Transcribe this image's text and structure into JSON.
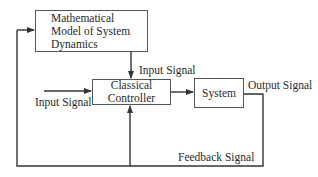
{
  "diagram": {
    "blocks": {
      "model": {
        "lines": [
          "Mathematical",
          "Model of System",
          "Dynamics"
        ]
      },
      "controller": {
        "lines": [
          "Classical",
          "Controller"
        ]
      },
      "system": {
        "lines": [
          "System"
        ]
      }
    },
    "labels": {
      "model_to_controller": "Input Signal",
      "external_input": "Input Signal",
      "output": "Output Signal",
      "feedback": "Feedback Signal"
    },
    "colors": {
      "line": "#333333",
      "box_border": "#555555",
      "text": "#2a2a2a"
    }
  }
}
